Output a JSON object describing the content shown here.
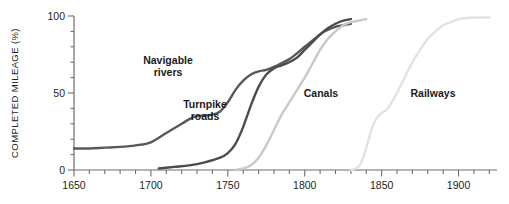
{
  "chart_data": {
    "type": "line",
    "title": "",
    "xlabel": "",
    "ylabel": "COMPLETED MILEAGE (%)",
    "xlim": [
      1650,
      1925
    ],
    "ylim": [
      0,
      100
    ],
    "grid": false,
    "legend": "inline-labels",
    "x_ticks_major": [
      1650,
      1700,
      1750,
      1800,
      1850,
      1900
    ],
    "x_tick_labels": [
      "1650",
      "1700",
      "1750",
      "1800",
      "1850",
      "1900"
    ],
    "x_minor_step": 10,
    "y_ticks_major": [
      0,
      50,
      100
    ],
    "y_tick_labels": [
      "0",
      "50",
      "100"
    ],
    "y_minor_step": 10,
    "series": [
      {
        "name": "Navigable rivers",
        "color": "#595959",
        "label_x": 168,
        "label_y": 66,
        "label_lines": [
          "Navigable",
          "rivers"
        ],
        "points": [
          [
            1650,
            14
          ],
          [
            1660,
            14
          ],
          [
            1670,
            14.5
          ],
          [
            1680,
            15
          ],
          [
            1690,
            16
          ],
          [
            1700,
            18
          ],
          [
            1710,
            24
          ],
          [
            1720,
            30
          ],
          [
            1725,
            33
          ],
          [
            1730,
            35
          ],
          [
            1740,
            36
          ],
          [
            1745,
            38
          ],
          [
            1750,
            44
          ],
          [
            1755,
            52
          ],
          [
            1760,
            58
          ],
          [
            1765,
            62
          ],
          [
            1770,
            64
          ],
          [
            1775,
            65
          ],
          [
            1780,
            67
          ],
          [
            1790,
            72
          ],
          [
            1800,
            80
          ],
          [
            1810,
            88
          ],
          [
            1815,
            91
          ],
          [
            1820,
            93
          ],
          [
            1825,
            94
          ],
          [
            1830,
            95
          ]
        ]
      },
      {
        "name": "Turnpike roads",
        "color": "#4d4d4d",
        "label_x": 205,
        "label_y": 110,
        "label_lines": [
          "Turnpike",
          "roads"
        ],
        "points": [
          [
            1705,
            1
          ],
          [
            1715,
            2
          ],
          [
            1725,
            3
          ],
          [
            1735,
            5
          ],
          [
            1745,
            8
          ],
          [
            1750,
            11
          ],
          [
            1755,
            17
          ],
          [
            1760,
            28
          ],
          [
            1765,
            42
          ],
          [
            1770,
            54
          ],
          [
            1775,
            62
          ],
          [
            1780,
            66
          ],
          [
            1785,
            68
          ],
          [
            1790,
            70
          ],
          [
            1795,
            73
          ],
          [
            1800,
            78
          ],
          [
            1805,
            83
          ],
          [
            1810,
            88
          ],
          [
            1815,
            92
          ],
          [
            1820,
            95
          ],
          [
            1825,
            97
          ],
          [
            1830,
            98
          ]
        ]
      },
      {
        "name": "Canals",
        "color": "#c9c9c9",
        "label_x": 321,
        "label_y": 93,
        "label_lines": [
          "Canals"
        ],
        "points": [
          [
            1755,
            0
          ],
          [
            1760,
            1
          ],
          [
            1765,
            3
          ],
          [
            1770,
            8
          ],
          [
            1775,
            16
          ],
          [
            1780,
            26
          ],
          [
            1785,
            36
          ],
          [
            1790,
            44
          ],
          [
            1795,
            52
          ],
          [
            1800,
            60
          ],
          [
            1805,
            69
          ],
          [
            1810,
            78
          ],
          [
            1815,
            85
          ],
          [
            1820,
            90
          ],
          [
            1825,
            94
          ],
          [
            1830,
            96
          ],
          [
            1835,
            97
          ],
          [
            1840,
            98
          ]
        ]
      },
      {
        "name": "Railways",
        "color": "#e2e2e2",
        "label_x": 433,
        "label_y": 93,
        "label_lines": [
          "Railways"
        ],
        "points": [
          [
            1830,
            0
          ],
          [
            1835,
            2
          ],
          [
            1838,
            8
          ],
          [
            1841,
            18
          ],
          [
            1844,
            28
          ],
          [
            1847,
            34
          ],
          [
            1850,
            37
          ],
          [
            1853,
            39
          ],
          [
            1856,
            43
          ],
          [
            1860,
            50
          ],
          [
            1865,
            60
          ],
          [
            1870,
            70
          ],
          [
            1875,
            78
          ],
          [
            1880,
            85
          ],
          [
            1885,
            90
          ],
          [
            1890,
            94
          ],
          [
            1895,
            96
          ],
          [
            1900,
            98
          ],
          [
            1910,
            99
          ],
          [
            1920,
            99
          ]
        ]
      }
    ]
  },
  "axes": {
    "axis_color": "#6d6d6d",
    "text_color": "#231f20"
  }
}
